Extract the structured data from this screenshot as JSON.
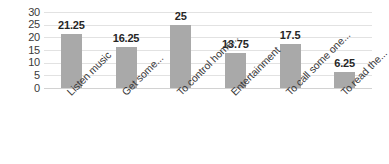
{
  "chart_data": {
    "type": "bar",
    "title": "",
    "subtitle": "",
    "xlabel": "",
    "ylabel": "",
    "ylim": [
      0,
      30
    ],
    "yticks": [
      "0",
      "5",
      "10",
      "15",
      "20",
      "25",
      "30"
    ],
    "ytick_values": [
      0,
      5,
      10,
      15,
      20,
      25,
      30
    ],
    "grid": true,
    "legend": false,
    "legend_position": "none",
    "categories": [
      "Listen music",
      "Get some...",
      "To control home...",
      "Entertainment",
      "To call some one...",
      "To read the..."
    ],
    "values": [
      21.25,
      16.25,
      25,
      13.75,
      17.5,
      6.25
    ],
    "data_labels": [
      "21.25",
      "16.25",
      "25",
      "13.75",
      "17.5",
      "6.25"
    ],
    "bar_color": "#a9a9a9",
    "grid_color": "#e2e2e2",
    "label_color": "#262626",
    "axis_text_color": "#3a3a3a"
  }
}
